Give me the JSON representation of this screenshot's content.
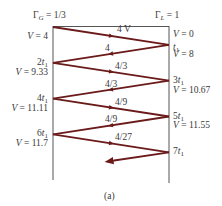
{
  "diagram": {
    "type": "bounce-diagram",
    "gamma_g_label": "Γ",
    "gamma_g_sub": "G",
    "gamma_g_value": " = 1/3",
    "gamma_l_label": "Γ",
    "gamma_l_sub": "L",
    "gamma_l_value": " = 1",
    "line_color": "#6b1a1a",
    "axis_color": "#555555",
    "waves": [
      {
        "label": "4 V",
        "direction": "right"
      },
      {
        "label": "4",
        "direction": "left"
      },
      {
        "label": "4/3",
        "direction": "right"
      },
      {
        "label": "4/3",
        "direction": "left"
      },
      {
        "label": "4/9",
        "direction": "right"
      },
      {
        "label": "4/9",
        "direction": "left"
      },
      {
        "label": "4/27",
        "direction": "right"
      },
      {
        "label": "",
        "direction": "left"
      }
    ],
    "left_labels": [
      {
        "kind": "voltage",
        "prefix": "V",
        "text": " = 4"
      },
      {
        "kind": "time",
        "coef": "2",
        "var": "t",
        "sub": "1"
      },
      {
        "kind": "voltage",
        "prefix": "V",
        "text": " = 9.33"
      },
      {
        "kind": "time",
        "coef": "4",
        "var": "t",
        "sub": "1"
      },
      {
        "kind": "voltage",
        "prefix": "V",
        "text": " = 11.11"
      },
      {
        "kind": "time",
        "coef": "6",
        "var": "t",
        "sub": "1"
      },
      {
        "kind": "voltage",
        "prefix": "V",
        "text": " = 11.7"
      }
    ],
    "right_labels": [
      {
        "kind": "voltage",
        "prefix": "V",
        "text": " = 0"
      },
      {
        "kind": "time",
        "coef": "",
        "var": "t",
        "sub": "1"
      },
      {
        "kind": "voltage",
        "prefix": "V",
        "text": " = 8"
      },
      {
        "kind": "time",
        "coef": "3",
        "var": "t",
        "sub": "1"
      },
      {
        "kind": "voltage",
        "prefix": "V",
        "text": " = 10.67"
      },
      {
        "kind": "time",
        "coef": "5",
        "var": "t",
        "sub": "1"
      },
      {
        "kind": "voltage",
        "prefix": "V",
        "text": " = 11.55"
      },
      {
        "kind": "time",
        "coef": "7",
        "var": "t",
        "sub": "1"
      }
    ],
    "caption": "(a)"
  }
}
